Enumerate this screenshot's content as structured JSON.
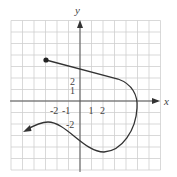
{
  "graph": {
    "axes": {
      "x_label": "x",
      "y_label": "y",
      "x_range": [
        -6,
        7
      ],
      "y_range": [
        -6,
        7
      ]
    },
    "x_ticks": [
      "-2",
      "-1",
      "1",
      "2"
    ],
    "y_ticks": [
      "2",
      "1",
      "-2"
    ],
    "colors": {
      "grid": "#cfcfcf",
      "axis": "#555555",
      "curve": "#333333"
    },
    "curve": {
      "start_point": "closed dot at (-3, 3.5)",
      "end": "arrow toward lower-left",
      "key_points": [
        {
          "x": -3,
          "y": 3.5
        },
        {
          "x": 3.5,
          "y": 1.8
        },
        {
          "x": 5,
          "y": -0.4
        },
        {
          "x": 2,
          "y": -4.4
        },
        {
          "x": -2.8,
          "y": -1.8
        },
        {
          "x": -4.9,
          "y": -2.6
        }
      ]
    }
  }
}
